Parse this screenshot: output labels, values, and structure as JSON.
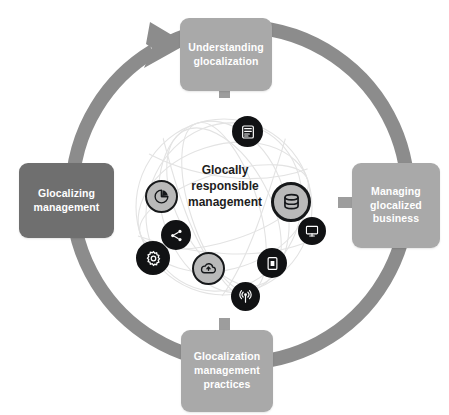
{
  "diagram": {
    "center": {
      "label_line1": "Glocally",
      "label_line2": "responsible",
      "label_line3": "management",
      "text_color": "#1d1d1d"
    },
    "ring": {
      "color": "#8c8c8c",
      "direction": "clockwise",
      "arrow_position": "upper-left"
    },
    "boxes": [
      {
        "id": "understanding-glocalization",
        "position": "top",
        "line1": "Understanding",
        "line2": "glocalization",
        "line3": "",
        "color": "#a9a9a9",
        "text_color": "#ffffff"
      },
      {
        "id": "managing-glocalized-business",
        "position": "right",
        "line1": "Managing",
        "line2": "glocalized",
        "line3": "business",
        "color": "#a9a9a9",
        "text_color": "#ffffff"
      },
      {
        "id": "glocalization-management-practices",
        "position": "bottom",
        "line1": "Glocalization",
        "line2": "management",
        "line3": "practices",
        "color": "#a9a9a9",
        "text_color": "#ffffff"
      },
      {
        "id": "glocalizing-management",
        "position": "left",
        "line1": "Glocalizing",
        "line2": "management",
        "line3": "",
        "color": "#6f6f6f",
        "text_color": "#ffffff"
      }
    ],
    "icons": [
      {
        "id": "server-icon",
        "name": "server-rack-icon",
        "style": "dark",
        "x": 232,
        "y": 116,
        "size": 31
      },
      {
        "id": "database-icon",
        "name": "database-icon",
        "style": "light",
        "x": 271,
        "y": 182,
        "size": 40
      },
      {
        "id": "monitor-icon",
        "name": "monitor-icon",
        "style": "dark",
        "x": 298,
        "y": 217,
        "size": 28
      },
      {
        "id": "tablet-icon",
        "name": "tablet-device-icon",
        "style": "dark",
        "x": 257,
        "y": 248,
        "size": 30
      },
      {
        "id": "antenna-icon",
        "name": "broadcast-antenna-icon",
        "style": "dark",
        "x": 231,
        "y": 282,
        "size": 29
      },
      {
        "id": "cloud-icon",
        "name": "cloud-icon",
        "style": "light",
        "x": 192,
        "y": 252,
        "size": 33
      },
      {
        "id": "gear-icon",
        "name": "gear-settings-icon",
        "style": "dark",
        "x": 136,
        "y": 241,
        "size": 34
      },
      {
        "id": "share-icon",
        "name": "share-network-icon",
        "style": "dark",
        "x": 161,
        "y": 220,
        "size": 30
      },
      {
        "id": "pie-icon",
        "name": "pie-chart-icon",
        "style": "light",
        "x": 145,
        "y": 180,
        "size": 33
      }
    ]
  }
}
